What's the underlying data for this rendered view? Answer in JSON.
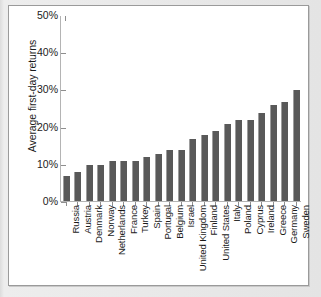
{
  "chart_data": {
    "type": "bar",
    "title": "",
    "xlabel": "",
    "ylabel": "Average first-day returns",
    "ylim": [
      0,
      50
    ],
    "yticks": [
      "0%",
      "10%",
      "20%",
      "30%",
      "40%",
      "50%"
    ],
    "ytick_values": [
      0,
      10,
      20,
      30,
      40,
      50
    ],
    "grid": false,
    "legend": "none",
    "value_suffix": "%",
    "bar_color": "#595959",
    "axis_color": "#b4b4b4",
    "panel_color": "#ffffff",
    "frame_color": "#e4e4e4",
    "categories": [
      "Russia",
      "Austria",
      "Denmark",
      "Norway",
      "Netherlands",
      "France",
      "Turkey",
      "Spain",
      "Portugal",
      "Belgium",
      "Israel",
      "United Kingdom",
      "Finland",
      "United States",
      "Italy",
      "Poland",
      "Cyprus",
      "Ireland",
      "Greece",
      "Germany",
      "Sweden"
    ],
    "values": [
      7,
      8,
      10,
      10,
      11,
      11,
      11,
      12,
      13,
      14,
      14,
      17,
      18,
      19,
      21,
      22,
      22,
      24,
      26,
      27,
      30
    ]
  }
}
